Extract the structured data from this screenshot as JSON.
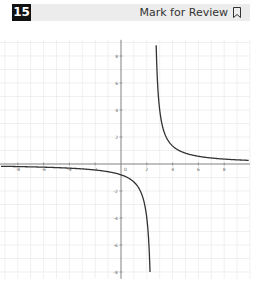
{
  "header": {
    "question_number": "15",
    "mark_for_review_label": "Mark for Review",
    "bookmark_icon": "bookmark-icon"
  },
  "colors": {
    "header_bg": "#ececec",
    "badge_bg": "#111111",
    "curve": "#333333",
    "axis": "#888888",
    "grid": "#e6e6e6"
  },
  "chart_data": {
    "type": "line",
    "title": "",
    "xlabel": "",
    "ylabel": "",
    "function_description": "Hyperbola with vertical asymptote near x = 2.5 and horizontal asymptote y = 0 (approx. y = 2/(x - 2.5))",
    "xlim": [
      -9.4,
      10
    ],
    "ylim": [
      -8.5,
      9.2
    ],
    "grid": true,
    "x_ticks": [
      -8,
      -6,
      -4,
      -2,
      2,
      4,
      6,
      8
    ],
    "y_ticks": [
      8,
      6,
      4,
      2,
      -2,
      -4,
      -6,
      -8
    ],
    "series": [
      {
        "name": "left branch",
        "x": [
          -9,
          -8,
          -6,
          -4,
          -2,
          -1,
          0,
          1,
          1.5,
          1.75,
          2.25
        ],
        "y": [
          -0.17,
          -0.19,
          -0.24,
          -0.31,
          -0.44,
          -0.57,
          -0.8,
          -1.33,
          -2,
          -2.67,
          -8
        ]
      },
      {
        "name": "right branch",
        "x": [
          2.75,
          3,
          3.5,
          4,
          5,
          6,
          7,
          8,
          9,
          9.8
        ],
        "y": [
          8,
          4,
          2,
          1.33,
          0.8,
          0.57,
          0.44,
          0.36,
          0.31,
          0.27
        ]
      }
    ]
  }
}
